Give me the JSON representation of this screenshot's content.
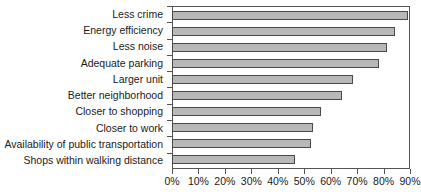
{
  "chart_data": {
    "type": "bar",
    "orientation": "horizontal",
    "title": "",
    "subtitle": "",
    "xlabel": "",
    "ylabel": "",
    "grid": false,
    "legend": null,
    "xlim": [
      0,
      90
    ],
    "x_tick_labels": [
      "0%",
      "10%",
      "20%",
      "30%",
      "40%",
      "50%",
      "60%",
      "70%",
      "80%",
      "90%"
    ],
    "x_tick_values": [
      0,
      10,
      20,
      30,
      40,
      50,
      60,
      70,
      80,
      90
    ],
    "categories": [
      "Less crime",
      "Energy efficiency",
      "Less noise",
      "Adequate parking",
      "Larger unit",
      "Better neighborhood",
      "Closer to shopping",
      "Closer to work",
      "Availability of public transportation",
      "Shops within walking distance"
    ],
    "values": [
      89,
      84,
      81,
      78,
      68,
      64,
      56,
      53,
      52,
      46
    ],
    "value_unit": "%",
    "bar_color": "#b8b8b8",
    "bar_border_color": "#4a4a4a",
    "axis_color": "#555555",
    "text_color": "#1a1a1a"
  }
}
